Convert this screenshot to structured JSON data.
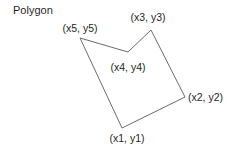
{
  "title": "Polygon",
  "diagram": {
    "background_color": "#ffffff",
    "line_color": "#6b6b6b",
    "text_color": "#1f1f1f",
    "polygon_points": "122,128 185,97 151,30 128,52 80,38",
    "vertices": [
      {
        "id": "x1",
        "label": "(x1, y1)"
      },
      {
        "id": "x2",
        "label": "(x2, y2)"
      },
      {
        "id": "x3",
        "label": "(x3, y3)"
      },
      {
        "id": "x4",
        "label": "(x4, y4)"
      },
      {
        "id": "x5",
        "label": "(x5, y5)"
      }
    ]
  }
}
